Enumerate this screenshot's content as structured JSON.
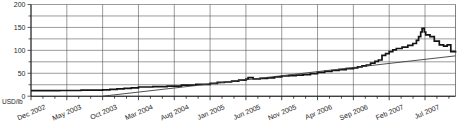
{
  "chart": {
    "unit_label": "USD/lb",
    "colors": {
      "background": "#ffffff",
      "price_line": "#141414",
      "trend_line": "#3c3c3c",
      "grid": "#4a4a4a",
      "axis": "#1a1a1a",
      "text": "#1f1f1f"
    }
  },
  "chart_data": {
    "type": "line",
    "title": "",
    "ylabel": "USD/lb",
    "ylim": [
      0,
      200
    ],
    "y_major_ticks": [
      0,
      50,
      100,
      150,
      200
    ],
    "y_minor_step": 25,
    "grid": "both",
    "legend": "none",
    "x_tick_labels": [
      "Dec 2002",
      "May 2003",
      "Oct 2003",
      "Mar 2004",
      "Aug 2004",
      "Jan 2005",
      "Jun 2005",
      "Nov 2005",
      "Apr 2006",
      "Sep 2006",
      "Feb 2007",
      "Jul 2007"
    ],
    "x_months_per_label": 5,
    "x_total_months": 59.26,
    "series": [
      {
        "name": "spot-price",
        "style": "step",
        "points": [
          [
            0,
            12
          ],
          [
            4,
            12.5
          ],
          [
            7,
            13
          ],
          [
            10,
            14
          ],
          [
            11,
            15
          ],
          [
            12,
            16
          ],
          [
            13,
            17
          ],
          [
            14,
            18
          ],
          [
            15,
            20
          ],
          [
            17,
            21
          ],
          [
            19,
            22
          ],
          [
            21,
            24
          ],
          [
            23,
            26
          ],
          [
            25,
            28
          ],
          [
            26,
            30
          ],
          [
            27,
            31
          ],
          [
            28,
            33
          ],
          [
            29,
            35
          ],
          [
            30,
            37
          ],
          [
            30.3,
            40.5
          ],
          [
            31,
            37.5
          ],
          [
            32,
            39
          ],
          [
            33,
            40
          ],
          [
            34,
            42
          ],
          [
            35,
            44
          ],
          [
            36,
            45
          ],
          [
            37,
            46
          ],
          [
            38,
            47
          ],
          [
            39,
            49
          ],
          [
            40,
            52
          ],
          [
            41,
            54
          ],
          [
            42,
            56
          ],
          [
            43,
            58
          ],
          [
            44,
            60
          ],
          [
            45,
            62
          ],
          [
            45.6,
            64
          ],
          [
            46.2,
            66
          ],
          [
            46.8,
            68
          ],
          [
            47.4,
            72
          ],
          [
            48,
            76
          ],
          [
            48.5,
            79
          ],
          [
            49,
            89
          ],
          [
            49.5,
            93
          ],
          [
            50,
            97
          ],
          [
            50.5,
            101
          ],
          [
            51,
            104
          ],
          [
            51.8,
            107
          ],
          [
            52.6,
            111
          ],
          [
            53.3,
            115
          ],
          [
            53.8,
            122
          ],
          [
            54.1,
            130
          ],
          [
            54.4,
            140
          ],
          [
            54.6,
            148
          ],
          [
            54.9,
            140
          ],
          [
            55.1,
            134
          ],
          [
            55.7,
            130
          ],
          [
            56.3,
            120
          ],
          [
            57,
            112
          ],
          [
            57.6,
            109
          ],
          [
            58.1,
            112
          ],
          [
            58.6,
            97
          ],
          [
            59.26,
            95
          ]
        ]
      },
      {
        "name": "trend",
        "style": "straight",
        "points": [
          [
            10,
            0
          ],
          [
            59.26,
            88
          ]
        ]
      }
    ]
  }
}
